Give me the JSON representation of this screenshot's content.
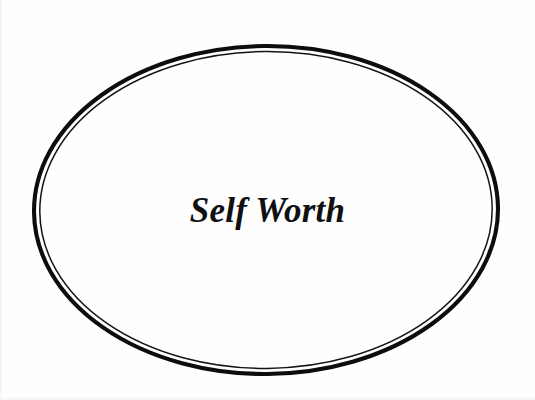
{
  "canvas": {
    "width": 535,
    "height": 400,
    "background_color": "#fefefe"
  },
  "diagram": {
    "type": "single-shape-label",
    "shape": {
      "kind": "ellipse",
      "style": "double-line-hand-drawn",
      "stroke_color": "#0d0d0d",
      "fill_color": "#ffffff",
      "center_x": 266,
      "center_y": 210,
      "radius_x": 232,
      "radius_y": 164,
      "outer_stroke_width": 4.1,
      "inner_stroke_width": 1.5
    },
    "label": {
      "text": "Self Worth",
      "color": "#101010",
      "font_size_px": 35,
      "font_style": "bold-italic-serif",
      "center_x": 268,
      "center_y": 211
    }
  }
}
